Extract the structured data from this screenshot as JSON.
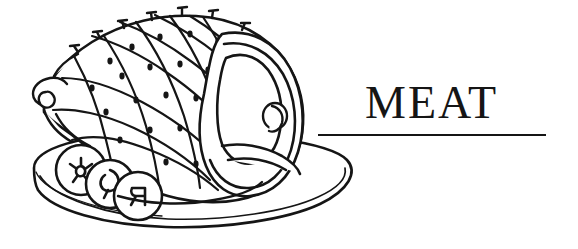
{
  "page": {
    "width": 578,
    "height": 249,
    "background_color": "#ffffff",
    "ink_color": "#151515",
    "kind": "cookbook-chapter-header"
  },
  "header": {
    "section_title": "MEAT",
    "rule_label": "horizontal-divider-rule"
  },
  "illustration": {
    "name": "glazed-ham-on-platter",
    "description": "Black line drawing of a scored, clove-studded baked ham resting on an oval serving platter with three fruit ring garnishes",
    "style": "pen-and-ink line art",
    "stroke_color": "#151515",
    "fill_color": "#ffffff",
    "parts": [
      {
        "name": "platter",
        "label": "oval serving platter with double rim"
      },
      {
        "name": "ham-body",
        "label": "ham with diamond-scored glazed surface"
      },
      {
        "name": "score-grid",
        "label": "diamond crosshatch scoring"
      },
      {
        "name": "cloves",
        "label": "clove studs in each diamond",
        "count": 22
      },
      {
        "name": "clove-spikes",
        "label": "clove spikes along top edge",
        "count": 7
      },
      {
        "name": "cut-face",
        "label": "sliced face of ham showing muscle and bone"
      },
      {
        "name": "bone-cross-section",
        "label": "round bone cross section"
      },
      {
        "name": "hock",
        "label": "shank bone end at left"
      },
      {
        "name": "garnish-rings",
        "label": "fruit ring garnishes",
        "count": 3
      }
    ]
  }
}
